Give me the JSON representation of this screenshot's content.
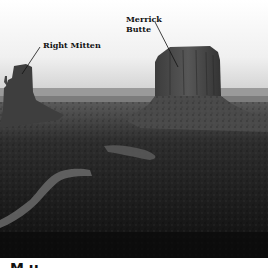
{
  "figure": {
    "labels": {
      "right_mitten": "Right Mitten",
      "merrick_butte": "Merrick Butte"
    },
    "caption_partial": "M          u"
  },
  "colors": {
    "sky": "#e8e8e8",
    "butte": "#4a4a4a",
    "ground_dark": "#1a1a1a",
    "road": "#6a6a6a"
  }
}
